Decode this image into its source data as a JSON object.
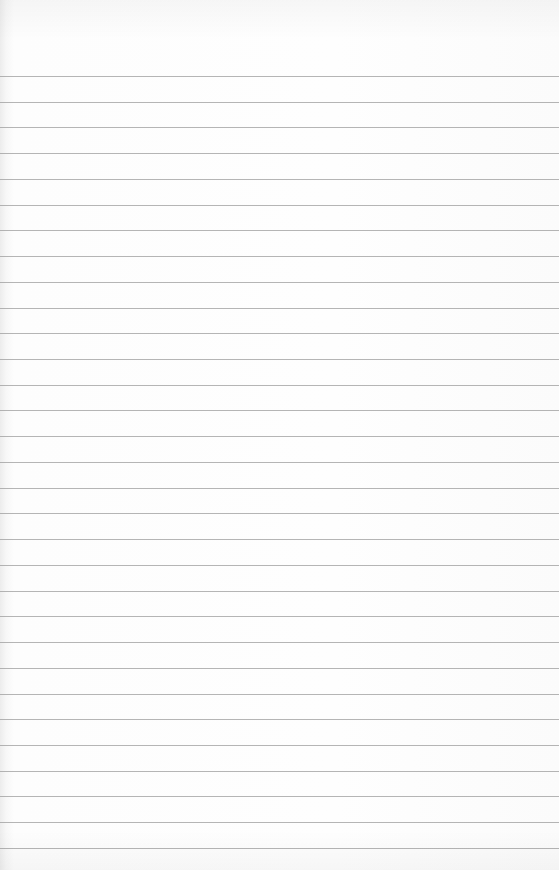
{
  "paper": {
    "type": "ruled-paper",
    "line_count": 31,
    "first_line_y": 76,
    "line_spacing": 25.73,
    "line_color": "#9c9c9c",
    "background_color": "#fdfdfd"
  }
}
